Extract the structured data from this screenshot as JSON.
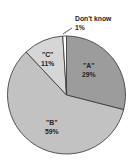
{
  "chart_data": {
    "type": "pie",
    "title": "",
    "categories": [
      "\"A\"",
      "\"B\"",
      "\"C\"",
      "Don't know"
    ],
    "values": [
      29,
      59,
      11,
      1
    ],
    "value_labels": [
      "29%",
      "59%",
      "11%",
      "1%"
    ],
    "colors": [
      "#9c9c9c",
      "#c2c2c2",
      "#d6d6d6",
      "#ffffff"
    ],
    "start_angle_deg": 0,
    "direction": "clockwise",
    "legend": "none",
    "annotations": [
      {
        "text": "Don't know",
        "subtext": "1%",
        "leader_line": true
      }
    ]
  },
  "labels": {
    "a_name": "\"A\"",
    "a_pct": "29%",
    "b_name": "\"B\"",
    "b_pct": "59%",
    "c_name": "\"C\"",
    "c_pct": "11%",
    "dk_name": "Don't know",
    "dk_pct": "1%"
  }
}
